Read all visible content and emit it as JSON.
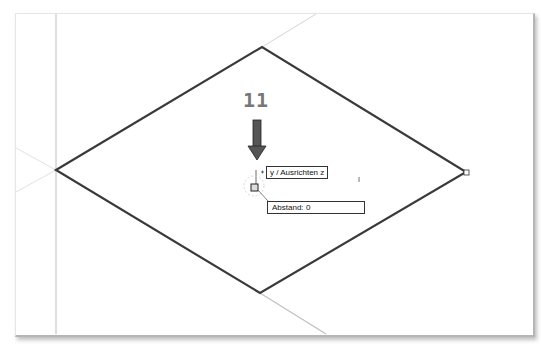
{
  "annotation": {
    "step_number": "11",
    "arrow_direction": "down"
  },
  "tooltips": {
    "snap_label": "y / Ausrichten z",
    "distance_label": "Abstand:",
    "distance_value": "0"
  },
  "cursor": {
    "text_cursor": "I"
  },
  "colors": {
    "diamond_stroke": "#3a3a3a",
    "construction_line": "#d0d0d0",
    "arrow_fill": "#555555",
    "step_text": "#777777"
  },
  "shape": {
    "type": "diamond",
    "vertices": {
      "left": [
        56,
        170
      ],
      "top": [
        262,
        47
      ],
      "right": [
        466,
        172
      ],
      "bottom": [
        260,
        293
      ]
    }
  }
}
